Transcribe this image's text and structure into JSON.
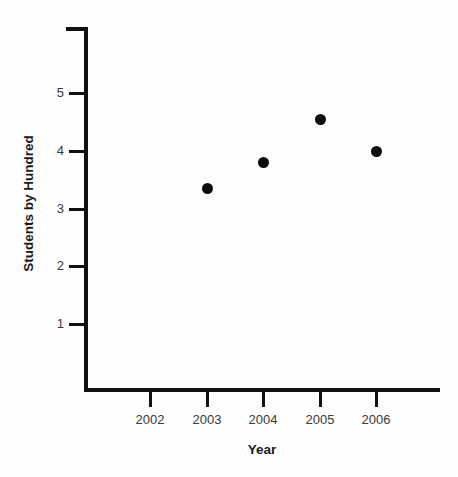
{
  "chart_data": {
    "type": "scatter",
    "title": "",
    "xlabel": "Year",
    "ylabel": "Students by Hundred",
    "x": [
      2003,
      2004,
      2005,
      2006
    ],
    "values": [
      3.35,
      3.8,
      4.55,
      4.0
    ],
    "points": [
      {
        "x": 2003,
        "y": 3.35
      },
      {
        "x": 2004,
        "y": 3.8
      },
      {
        "x": 2005,
        "y": 4.55
      },
      {
        "x": 2006,
        "y": 4.0
      }
    ],
    "x_tick_labels": [
      "2002",
      "2003",
      "2004",
      "2005",
      "2006"
    ],
    "x_tick_values": [
      2002,
      2003,
      2004,
      2005,
      2006
    ],
    "y_tick_labels": [
      "1",
      "2",
      "3",
      "4",
      "5"
    ],
    "y_tick_values": [
      1,
      2,
      3,
      4,
      5
    ],
    "xlim": [
      2001.6,
      2006.9
    ],
    "ylim": [
      0,
      6.15
    ],
    "grid": false,
    "legend": false,
    "marker_color": "#0d0d0d",
    "axis_color": "#111111",
    "background_color": "#fdfdfd",
    "label_color": "#3a3a3a"
  },
  "axes": {
    "x_title": "Year",
    "y_title": "Students by Hundred"
  },
  "x_ticks": [
    {
      "label": "2002"
    },
    {
      "label": "2003"
    },
    {
      "label": "2004"
    },
    {
      "label": "2005"
    },
    {
      "label": "2006"
    }
  ],
  "y_ticks": [
    {
      "label": "5"
    },
    {
      "label": "4"
    },
    {
      "label": "3"
    },
    {
      "label": "2"
    },
    {
      "label": "1"
    }
  ]
}
